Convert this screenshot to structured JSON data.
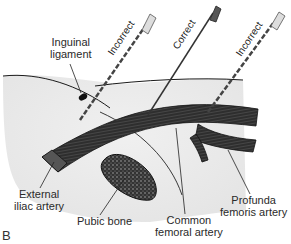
{
  "panel_letter": "B",
  "needles": [
    {
      "label": "Incorrect",
      "style": "dashed",
      "position": "left"
    },
    {
      "label": "Correct",
      "style": "solid",
      "position": "center"
    },
    {
      "label": "Incorrect",
      "style": "dashed",
      "position": "right"
    }
  ],
  "labels": {
    "inguinal_ligament": [
      "Inguinal",
      "ligament"
    ],
    "external_iliac_artery": [
      "External",
      "iliac artery"
    ],
    "pubic_bone": "Pubic bone",
    "common_femoral_artery": [
      "Common",
      "femoral artery"
    ],
    "profunda_femoris_artery": [
      "Profunda",
      "femoris artery"
    ]
  },
  "colors": {
    "skin": "#e8e8e8",
    "artery": "#3a3a3a",
    "outline": "#1a1a1a",
    "bone_fill": "#555555"
  }
}
